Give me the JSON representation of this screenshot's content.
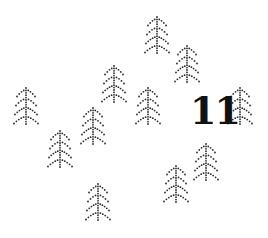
{
  "scene": {
    "width": 268,
    "height": 238,
    "background": "#ffffff",
    "dot_color": "#2a2a2a",
    "tree_count": 11
  },
  "label": {
    "text": "11",
    "x": 190,
    "y": 92,
    "font_size": 38,
    "color": "#111111"
  },
  "trees": [
    {
      "id": "A",
      "x": 157,
      "y": 17
    },
    {
      "id": "B",
      "x": 187,
      "y": 46
    },
    {
      "id": "C",
      "x": 114,
      "y": 66
    },
    {
      "id": "D",
      "x": 26,
      "y": 88
    },
    {
      "id": "E",
      "x": 148,
      "y": 88
    },
    {
      "id": "F",
      "x": 240,
      "y": 88
    },
    {
      "id": "G",
      "x": 93,
      "y": 108
    },
    {
      "id": "H",
      "x": 60,
      "y": 131
    },
    {
      "id": "I",
      "x": 206,
      "y": 144
    },
    {
      "id": "J",
      "x": 176,
      "y": 166
    },
    {
      "id": "K",
      "x": 98,
      "y": 184
    }
  ],
  "tree_shape": {
    "tiers": 4,
    "tier_spacing": 9,
    "tier_half_width": 12,
    "tier_drop": 7,
    "dot_radius": 0.9,
    "dot_step": 2.4
  }
}
